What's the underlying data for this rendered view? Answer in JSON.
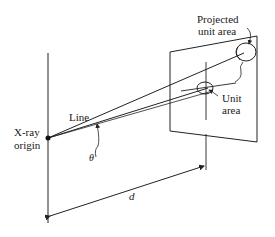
{
  "diagram": {
    "labels": {
      "projected_unit_area_line1": "Projected",
      "projected_unit_area_line2": "unit area",
      "unit_area_line1": "Unit",
      "unit_area_line2": "area",
      "line": "Line",
      "theta": "θ",
      "xray_origin_line1": "X-ray",
      "xray_origin_line2": "origin",
      "distance": "d"
    },
    "colors": {
      "stroke": "#222222",
      "background": "#ffffff"
    }
  }
}
